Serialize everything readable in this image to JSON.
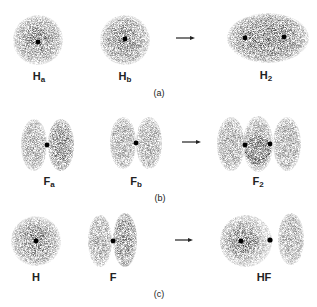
{
  "figure": {
    "panels": [
      {
        "id": "a",
        "caption": "(a)",
        "atoms": [
          {
            "symbol": "H",
            "subscript": "a"
          },
          {
            "symbol": "H",
            "subscript": "b"
          }
        ],
        "product": {
          "symbol": "H",
          "subscript": "2"
        }
      },
      {
        "id": "b",
        "caption": "(b)",
        "atoms": [
          {
            "symbol": "F",
            "subscript": "a"
          },
          {
            "symbol": "F",
            "subscript": "b"
          }
        ],
        "product": {
          "symbol": "F",
          "subscript": "2"
        }
      },
      {
        "id": "c",
        "caption": "(c)",
        "atoms": [
          {
            "symbol": "H",
            "subscript": ""
          },
          {
            "symbol": "F",
            "subscript": ""
          }
        ],
        "product": {
          "symbol": "HF",
          "subscript": ""
        }
      }
    ],
    "arrow_symbol": "→",
    "colors": {
      "cloud_dark": "#333333",
      "cloud_mid": "#777777",
      "cloud_light": "#bbbbbb",
      "nucleus": "#000000"
    }
  }
}
